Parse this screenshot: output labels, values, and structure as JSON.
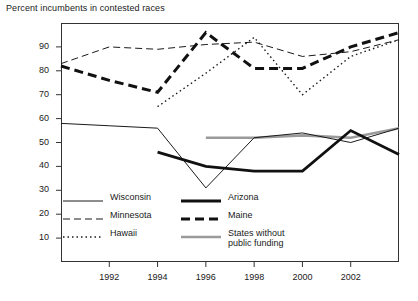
{
  "chart_data": {
    "type": "line",
    "title": "Percent incumbents in contested races",
    "xlabel": "",
    "ylabel": "",
    "xlim": [
      1990,
      2004
    ],
    "ylim": [
      0,
      100
    ],
    "yticks": [
      10,
      20,
      30,
      40,
      50,
      60,
      70,
      80,
      90
    ],
    "xticks": [
      1992,
      1994,
      1996,
      1998,
      2000,
      2002
    ],
    "grid": false,
    "legend_position": "inside-lower-left",
    "series": [
      {
        "name": "Wisconsin",
        "style": "thin-solid",
        "color": "#1a1a1a",
        "x": [
          1990,
          1992,
          1994,
          1996,
          1998,
          2000,
          2002,
          2004
        ],
        "values": [
          58,
          57,
          56,
          31,
          52,
          54,
          50,
          56
        ]
      },
      {
        "name": "Minnesota",
        "style": "thin-dashed",
        "color": "#1a1a1a",
        "x": [
          1990,
          1992,
          1994,
          1996,
          1998,
          2000,
          2002,
          2004
        ],
        "values": [
          83,
          90,
          89,
          91,
          92,
          86,
          88,
          93
        ]
      },
      {
        "name": "Hawaii",
        "style": "dotted",
        "color": "#1a1a1a",
        "x": [
          1994,
          1996,
          1998,
          2000,
          2002,
          2004
        ],
        "values": [
          65,
          79,
          94,
          70,
          86,
          93
        ]
      },
      {
        "name": "Arizona",
        "style": "thick-solid",
        "color": "#111111",
        "x": [
          1994,
          1996,
          1998,
          2000,
          2002,
          2004
        ],
        "values": [
          46,
          40,
          38,
          38,
          55,
          45
        ]
      },
      {
        "name": "Maine",
        "style": "thick-dashed",
        "color": "#111111",
        "x": [
          1990,
          1992,
          1994,
          1996,
          1998,
          2000,
          2002,
          2004
        ],
        "values": [
          82,
          76,
          71,
          96,
          81,
          81,
          90,
          96
        ]
      },
      {
        "name": "States without public funding",
        "style": "thick-gray-solid",
        "color": "#9a9a9a",
        "x": [
          1996,
          1998,
          2000,
          2002,
          2004
        ],
        "values": [
          52,
          52,
          53,
          52,
          56
        ]
      }
    ]
  },
  "legend": {
    "items": [
      {
        "label": "Wisconsin",
        "swatch": "thin-solid"
      },
      {
        "label": "Arizona",
        "swatch": "thick-solid"
      },
      {
        "label": "Minnesota",
        "swatch": "thin-dashed"
      },
      {
        "label": "Maine",
        "swatch": "thick-dashed"
      },
      {
        "label": "Hawaii",
        "swatch": "dotted"
      },
      {
        "label": "States without public funding",
        "swatch": "thick-gray-solid"
      }
    ]
  },
  "axis": {
    "ylabels": [
      "90",
      "80",
      "70",
      "60",
      "50",
      "40",
      "30",
      "20",
      "10"
    ],
    "xlabels": [
      "1992",
      "1994",
      "1996",
      "1998",
      "2000",
      "2002"
    ]
  }
}
